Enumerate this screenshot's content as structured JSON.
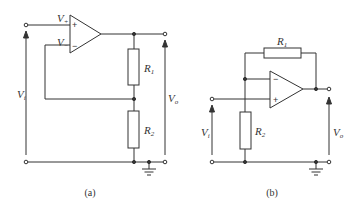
{
  "figures": [
    {
      "id": "a",
      "caption": "(a)",
      "labels": {
        "v_plus": "V",
        "v_plus_sub": "+",
        "v_minus": "V",
        "v_minus_sub": "−",
        "r1": "R",
        "r1_sub": "1",
        "r2": "R",
        "r2_sub": "2",
        "vi": "V",
        "vi_sub": "i",
        "vo": "V",
        "vo_sub": "o",
        "plus_sign": "+",
        "minus_sign": "−"
      }
    },
    {
      "id": "b",
      "caption": "(b)",
      "labels": {
        "r1": "R",
        "r1_sub": "1",
        "r2": "R",
        "r2_sub": "2",
        "vi": "V",
        "vi_sub": "i",
        "vo": "V",
        "vo_sub": "o",
        "plus_sign": "+",
        "minus_sign": "−"
      }
    }
  ],
  "colors": {
    "line": "#333333",
    "background": "#ffffff"
  }
}
